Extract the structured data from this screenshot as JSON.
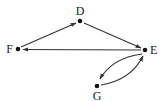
{
  "diagram": {
    "type": "directed-graph",
    "colors": {
      "background": "#ffffff",
      "ink": "#222222"
    },
    "nodes": [
      {
        "id": "D",
        "label": "D",
        "x": 80,
        "y": 21
      },
      {
        "id": "E",
        "label": "E",
        "x": 145,
        "y": 50
      },
      {
        "id": "F",
        "label": "F",
        "x": 18,
        "y": 49
      },
      {
        "id": "G",
        "label": "G",
        "x": 97,
        "y": 86
      }
    ],
    "edges": [
      {
        "from": "F",
        "to": "D",
        "shape": "straight"
      },
      {
        "from": "D",
        "to": "E",
        "shape": "straight"
      },
      {
        "from": "E",
        "to": "F",
        "shape": "straight"
      },
      {
        "from": "E",
        "to": "G",
        "shape": "curved"
      },
      {
        "from": "G",
        "to": "E",
        "shape": "curved"
      }
    ]
  }
}
